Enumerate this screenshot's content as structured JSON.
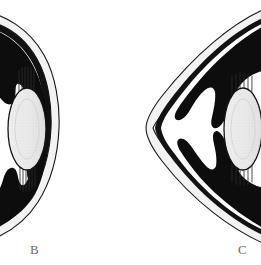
{
  "figure": {
    "background_color": "#ffffff",
    "ink_color": "#0d0d0d",
    "lens_fill_color": "#e9e9e9",
    "sclera_fill_color": "#f2f2f2",
    "label_color": "#6b6b6b",
    "width": 261,
    "height": 265
  },
  "panels": [
    {
      "id": "b",
      "label": "B",
      "label_x": 30,
      "label_y": 243,
      "shape": "rounded globe profile, left-facing crescent",
      "parts": {
        "sclera": "sclera-cornea-arc",
        "ciliary_body_upper": "ciliary-body-upper",
        "ciliary_body_lower": "ciliary-body-lower",
        "lens": "lens-ellipse",
        "zonules_upper": "zonular-fibers-upper",
        "zonules_lower": "zonular-fibers-lower"
      }
    },
    {
      "id": "c",
      "label": "C",
      "label_x": 238,
      "label_y": 243,
      "shape": "angular conical profile, apex pointing left",
      "parts": {
        "sclera": "sclera-cornea-arc",
        "ciliary_body_upper": "ciliary-body-upper",
        "ciliary_body_lower": "ciliary-body-lower",
        "lens": "lens-ellipse",
        "zonules_upper": "zonular-fibers-upper",
        "zonules_lower": "zonular-fibers-lower"
      }
    }
  ]
}
